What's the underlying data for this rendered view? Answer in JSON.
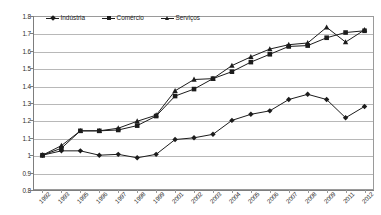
{
  "chart_data": {
    "type": "line",
    "title": "",
    "subtitle": "",
    "xlabel": "",
    "ylabel": "",
    "ylim": [
      0.8,
      1.8
    ],
    "ytick_step": 0.1,
    "yticks": [
      "1.8",
      "1.7",
      "1.6",
      "1.5",
      "1.4",
      "1.3",
      "1.2",
      "1.1",
      "1",
      "0.9",
      "0.8"
    ],
    "grid": true,
    "legend_position": "top-left-inside",
    "categories": [
      "1992",
      "1993",
      "1995",
      "1996",
      "1997",
      "1998",
      "1999",
      "2001",
      "2002",
      "2003",
      "2004",
      "2005",
      "2006",
      "2007",
      "2008",
      "2009",
      "2011",
      "2012"
    ],
    "series": [
      {
        "name": "Indústria",
        "marker": "diamond",
        "color": "#1c1c1c",
        "values": [
          1.0,
          1.025,
          1.025,
          1.0,
          1.005,
          0.985,
          1.005,
          1.09,
          1.1,
          1.12,
          1.2,
          1.235,
          1.255,
          1.32,
          1.35,
          1.32,
          1.215,
          1.28
        ]
      },
      {
        "name": "Comércio",
        "marker": "square",
        "color": "#1c1c1c",
        "values": [
          1.0,
          1.04,
          1.14,
          1.14,
          1.145,
          1.17,
          1.225,
          1.34,
          1.38,
          1.44,
          1.48,
          1.535,
          1.58,
          1.625,
          1.63,
          1.675,
          1.705,
          1.715
        ]
      },
      {
        "name": "Serviços",
        "marker": "triangle",
        "color": "#1c1c1c",
        "values": [
          1.0,
          1.055,
          1.14,
          1.14,
          1.155,
          1.195,
          1.23,
          1.37,
          1.435,
          1.44,
          1.515,
          1.565,
          1.61,
          1.635,
          1.645,
          1.735,
          1.65,
          1.72
        ]
      }
    ]
  },
  "legend": {
    "items": [
      {
        "label": "Indústria"
      },
      {
        "label": "Comércio"
      },
      {
        "label": "Serviços"
      }
    ]
  }
}
